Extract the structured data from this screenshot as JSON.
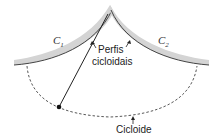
{
  "diagram": {
    "labels": {
      "c1": "C",
      "c1_sub": "1",
      "c2": "C",
      "c2_sub": "2",
      "profiles_line1": "Perfis",
      "profiles_line2": "cicloidais",
      "cycloid": "Cicloide"
    },
    "colors": {
      "cheek_fill": "#d4d4d4",
      "cheek_edge": "#444444",
      "string": "#222222",
      "cycloid_dash": "#444444",
      "bob": "#111111"
    }
  }
}
